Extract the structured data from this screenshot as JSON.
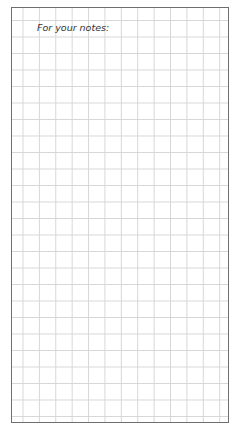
{
  "notes_page": {
    "label": "For your notes:",
    "grid": {
      "columns": 13,
      "rows": 25,
      "line_color": "#d6d6d6",
      "border_color": "#6e6e6e"
    }
  }
}
